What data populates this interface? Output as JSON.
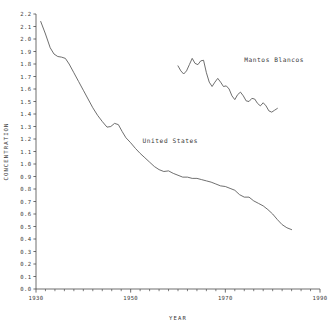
{
  "chart_data": {
    "type": "line",
    "title": "",
    "xlabel": "YEAR",
    "ylabel": "CONCENTRATION",
    "xlim": [
      1930,
      1990
    ],
    "ylim": [
      0.0,
      2.2
    ],
    "grid": false,
    "legend": "inline-annotations",
    "x_ticks": [
      1930,
      1950,
      1970,
      1990
    ],
    "x_tick_labels": [
      "1930",
      "1950",
      "1970",
      "1990"
    ],
    "x_minor_tick_step": 2,
    "y_ticks": [
      0.0,
      0.1,
      0.2,
      0.3,
      0.4,
      0.5,
      0.6,
      0.7,
      0.8,
      0.9,
      1.0,
      1.1,
      1.2,
      1.3,
      1.4,
      1.5,
      1.6,
      1.7,
      1.8,
      1.9,
      2.0,
      2.1,
      2.2
    ],
    "y_tick_labels": [
      "0.0",
      "0.1",
      "0.2",
      "0.3",
      "0.4",
      "0.5",
      "0.6",
      "0.7",
      "0.8",
      "0.9",
      "1.0",
      "1.1",
      "1.2",
      "1.3",
      "1.4",
      "1.5",
      "1.6",
      "1.7",
      "1.8",
      "1.9",
      "2.0",
      "2.1",
      "2.2"
    ],
    "line_color": "#555555",
    "series": [
      {
        "name": "United States",
        "label_x": 1952.5,
        "label_y": 1.17,
        "x": [
          1931.0,
          1932.0,
          1933.0,
          1933.8,
          1934.6,
          1935.4,
          1936.2,
          1937.0,
          1938.0,
          1939.0,
          1940.0,
          1941.0,
          1942.0,
          1943.0,
          1944.0,
          1945.0,
          1945.8,
          1946.6,
          1947.4,
          1948.2,
          1949.0,
          1950.0,
          1951.0,
          1952.0,
          1953.0,
          1954.0,
          1955.0,
          1956.0,
          1957.0,
          1958.0,
          1959.0,
          1960.0,
          1961.0,
          1962.0,
          1963.0,
          1964.0,
          1965.0,
          1966.0,
          1967.0,
          1968.0,
          1969.0,
          1970.0,
          1971.0,
          1972.0,
          1973.0,
          1974.0,
          1975.0,
          1976.0,
          1977.0,
          1978.0,
          1979.0,
          1980.0,
          1981.0,
          1982.0,
          1983.0,
          1984.0
        ],
        "y": [
          2.14,
          2.04,
          1.93,
          1.88,
          1.86,
          1.855,
          1.845,
          1.8,
          1.73,
          1.66,
          1.59,
          1.52,
          1.45,
          1.39,
          1.34,
          1.295,
          1.3,
          1.325,
          1.315,
          1.26,
          1.21,
          1.17,
          1.125,
          1.085,
          1.05,
          1.015,
          0.98,
          0.955,
          0.94,
          0.945,
          0.925,
          0.91,
          0.895,
          0.895,
          0.885,
          0.885,
          0.875,
          0.865,
          0.855,
          0.84,
          0.825,
          0.82,
          0.805,
          0.79,
          0.755,
          0.735,
          0.735,
          0.705,
          0.685,
          0.665,
          0.635,
          0.6,
          0.555,
          0.515,
          0.49,
          0.475
        ]
      },
      {
        "name": "Mantos Blancos",
        "label_x": 1974.0,
        "label_y": 1.82,
        "x": [
          1960.0,
          1960.6,
          1961.2,
          1961.8,
          1962.4,
          1963.0,
          1963.6,
          1964.2,
          1964.8,
          1965.4,
          1966.0,
          1966.6,
          1967.2,
          1967.8,
          1968.4,
          1969.0,
          1969.6,
          1970.2,
          1970.8,
          1971.4,
          1972.0,
          1972.6,
          1973.2,
          1973.8,
          1974.4,
          1975.0,
          1975.6,
          1976.2,
          1976.8,
          1977.4,
          1978.0,
          1978.6,
          1979.2,
          1979.8,
          1980.4,
          1981.0
        ],
        "y": [
          1.785,
          1.745,
          1.72,
          1.745,
          1.795,
          1.845,
          1.805,
          1.795,
          1.825,
          1.83,
          1.73,
          1.655,
          1.62,
          1.655,
          1.685,
          1.655,
          1.62,
          1.625,
          1.6,
          1.545,
          1.515,
          1.555,
          1.575,
          1.545,
          1.505,
          1.5,
          1.525,
          1.52,
          1.485,
          1.465,
          1.49,
          1.465,
          1.425,
          1.415,
          1.43,
          1.445
        ]
      }
    ]
  }
}
